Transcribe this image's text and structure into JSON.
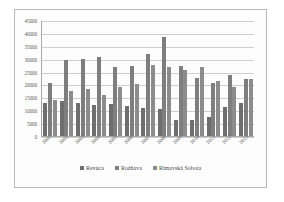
{
  "chart_data": {
    "type": "bar",
    "title": "",
    "xlabel": "",
    "ylabel": "",
    "ylim": [
      0,
      45000
    ],
    "yticks": [
      0,
      5000,
      10000,
      15000,
      20000,
      25000,
      30000,
      35000,
      40000,
      45000
    ],
    "ytick_labels": [
      "0",
      "5000",
      "10000",
      "15000",
      "20000",
      "25000",
      "30000",
      "35000",
      "40000",
      "45000"
    ],
    "grid": true,
    "legend_position": "bottom",
    "categories": [
      "2001",
      "2002",
      "2003",
      "2004",
      "2005",
      "2006",
      "2007",
      "2008",
      "2009",
      "2010",
      "2011",
      "2012",
      "2013"
    ],
    "series": [
      {
        "name": "Revúca",
        "color": "#6e6e6e",
        "values": [
          12800,
          13500,
          12700,
          11900,
          12400,
          11800,
          10700,
          10300,
          6400,
          6400,
          7300,
          11400,
          13000
        ]
      },
      {
        "name": "Rožňava",
        "color": "#7e7e7e",
        "values": [
          20700,
          29400,
          30000,
          30500,
          26700,
          27200,
          32000,
          38500,
          27200,
          22400,
          20500,
          23700,
          22200
        ]
      },
      {
        "name": "Rimavská Sobota",
        "color": "#8c8c8c",
        "values": [
          13900,
          17600,
          18300,
          15800,
          19000,
          20200,
          27600,
          26700,
          25700,
          26700,
          21500,
          19000,
          22300
        ]
      }
    ]
  },
  "legend": {
    "items": [
      {
        "label": "Revúca",
        "color": "#6e6e6e"
      },
      {
        "label": "Rožňava",
        "color": "#7e7e7e"
      },
      {
        "label": "Rimavská Sobota",
        "color": "#8c8c8c"
      }
    ]
  }
}
